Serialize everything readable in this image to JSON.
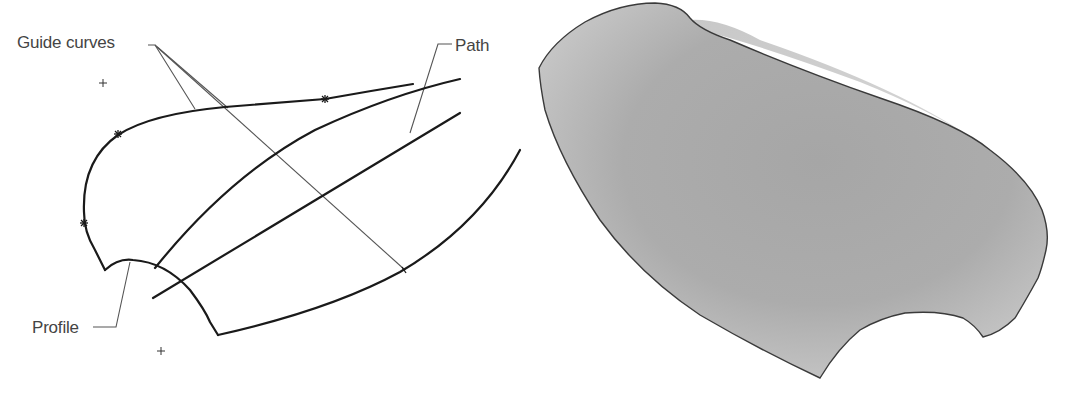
{
  "figure": {
    "left_panel": {
      "description": "Wireframe of sweep inputs",
      "labels": {
        "guide_curves": "Guide curves",
        "path": "Path",
        "profile": "Profile"
      },
      "markers": {
        "crosses": 2,
        "star_points": 3
      }
    },
    "right_panel": {
      "description": "Resulting swept surface (shaded)"
    },
    "colors": {
      "curve": "#1a1a1a",
      "leader": "#555555",
      "label_text": "#444444",
      "surface_light": "#d2d2d2",
      "surface_mid": "#a9a9a9",
      "surface_dark": "#9a9a9a",
      "surface_outline": "#3a3a3a"
    }
  }
}
